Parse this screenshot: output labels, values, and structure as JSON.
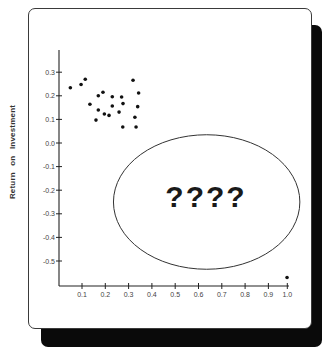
{
  "chart_data": {
    "type": "scatter",
    "title": "",
    "xlabel": "",
    "ylabel": "Return on Investment",
    "xlim": [
      0.0,
      1.0
    ],
    "ylim": [
      -0.6,
      0.35
    ],
    "x_ticks": [
      "0.1",
      "0.2",
      "0.3",
      "0.4",
      "0.5",
      "0.6",
      "0.7",
      "0.8",
      "0.9",
      "1.0"
    ],
    "y_ticks": [
      "0.3",
      "0.2",
      "0.1",
      "0.0",
      "-0.1",
      "-0.2",
      "-0.3",
      "-0.4",
      "-0.5"
    ],
    "grid": false,
    "legend": null,
    "points": [
      {
        "x": 0.05,
        "y": 0.234
      },
      {
        "x": 0.096,
        "y": 0.248
      },
      {
        "x": 0.114,
        "y": 0.27
      },
      {
        "x": 0.134,
        "y": 0.164
      },
      {
        "x": 0.16,
        "y": 0.097
      },
      {
        "x": 0.17,
        "y": 0.2
      },
      {
        "x": 0.17,
        "y": 0.14
      },
      {
        "x": 0.19,
        "y": 0.215
      },
      {
        "x": 0.196,
        "y": 0.123
      },
      {
        "x": 0.216,
        "y": 0.117
      },
      {
        "x": 0.23,
        "y": 0.196
      },
      {
        "x": 0.23,
        "y": 0.157
      },
      {
        "x": 0.259,
        "y": 0.131
      },
      {
        "x": 0.27,
        "y": 0.195
      },
      {
        "x": 0.276,
        "y": 0.167
      },
      {
        "x": 0.275,
        "y": 0.068
      },
      {
        "x": 0.319,
        "y": 0.266
      },
      {
        "x": 0.327,
        "y": 0.109
      },
      {
        "x": 0.332,
        "y": 0.068
      },
      {
        "x": 0.339,
        "y": 0.154
      },
      {
        "x": 0.343,
        "y": 0.212
      },
      {
        "x": 0.98,
        "y": -0.57
      }
    ],
    "annotations": [
      {
        "type": "ellipse",
        "center": {
          "x": 0.635,
          "y": -0.25
        },
        "rx": 0.4,
        "ry": 0.285
      },
      {
        "type": "text",
        "text": "????",
        "x": 0.63,
        "y": -0.23
      }
    ]
  },
  "annotation_text": "????"
}
